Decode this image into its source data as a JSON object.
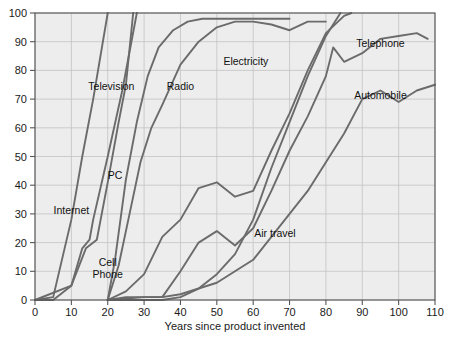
{
  "chart_data": {
    "type": "line",
    "title": "",
    "xlabel": "Years since product invented",
    "ylabel": "",
    "xlim": [
      0,
      110
    ],
    "ylim": [
      0,
      100
    ],
    "xticks": [
      0,
      10,
      20,
      30,
      40,
      50,
      60,
      70,
      80,
      90,
      100,
      110
    ],
    "yticks": [
      0,
      10,
      20,
      30,
      40,
      50,
      60,
      70,
      80,
      90,
      100
    ],
    "grid": true,
    "legend_position": "inline-labels",
    "series": [
      {
        "name": "Internet",
        "label": "Internet",
        "label_x": 10,
        "label_y": 30,
        "points": [
          [
            0,
            0
          ],
          [
            5,
            1
          ],
          [
            10,
            28
          ],
          [
            13,
            50
          ],
          [
            16,
            70
          ],
          [
            20,
            100
          ]
        ]
      },
      {
        "name": "Cell Phone",
        "label": "Cell Phone",
        "label_x": 20,
        "label_y": 12,
        "points": [
          [
            0,
            0
          ],
          [
            5,
            0
          ],
          [
            10,
            5
          ],
          [
            13,
            18
          ],
          [
            15,
            21
          ],
          [
            16,
            28
          ],
          [
            20,
            50
          ],
          [
            24,
            73
          ],
          [
            28,
            100
          ]
        ]
      },
      {
        "name": "PC",
        "label": "PC",
        "label_x": 22,
        "label_y": 42,
        "points": [
          [
            0,
            0
          ],
          [
            10,
            5
          ],
          [
            14,
            18
          ],
          [
            17,
            21
          ],
          [
            20,
            41
          ],
          [
            23,
            62
          ],
          [
            25,
            75
          ],
          [
            27,
            100
          ]
        ]
      },
      {
        "name": "Television",
        "label": "Television",
        "label_x": 21,
        "label_y": 73,
        "points": [
          [
            20,
            0
          ],
          [
            22,
            14
          ],
          [
            25,
            42
          ],
          [
            28,
            62
          ],
          [
            31,
            78
          ],
          [
            34,
            88
          ],
          [
            38,
            94
          ],
          [
            42,
            97
          ],
          [
            46,
            98
          ],
          [
            55,
            98
          ],
          [
            60,
            98
          ],
          [
            70,
            98
          ]
        ]
      },
      {
        "name": "Radio",
        "label": "Radio",
        "label_x": 40,
        "label_y": 73,
        "points": [
          [
            20,
            0
          ],
          [
            23,
            12
          ],
          [
            26,
            30
          ],
          [
            29,
            48
          ],
          [
            32,
            60
          ],
          [
            35,
            68
          ],
          [
            40,
            82
          ],
          [
            45,
            90
          ],
          [
            50,
            95
          ],
          [
            55,
            97
          ],
          [
            60,
            97
          ],
          [
            65,
            96
          ],
          [
            70,
            94
          ],
          [
            75,
            97
          ],
          [
            80,
            97
          ]
        ]
      },
      {
        "name": "Electricity",
        "label": "Electricity",
        "label_x": 58,
        "label_y": 82,
        "points": [
          [
            20,
            0
          ],
          [
            25,
            3
          ],
          [
            30,
            9
          ],
          [
            35,
            22
          ],
          [
            40,
            28
          ],
          [
            45,
            39
          ],
          [
            50,
            41
          ],
          [
            55,
            36
          ],
          [
            60,
            38
          ],
          [
            65,
            52
          ],
          [
            70,
            65
          ],
          [
            75,
            80
          ],
          [
            80,
            93
          ],
          [
            85,
            99
          ],
          [
            87,
            100
          ]
        ]
      },
      {
        "name": "Telephone",
        "label": "Telephone",
        "label_x": 95,
        "label_y": 88,
        "points": [
          [
            20,
            0
          ],
          [
            25,
            1
          ],
          [
            30,
            1
          ],
          [
            35,
            1
          ],
          [
            40,
            10
          ],
          [
            45,
            20
          ],
          [
            50,
            24
          ],
          [
            55,
            19
          ],
          [
            60,
            25
          ],
          [
            65,
            38
          ],
          [
            70,
            52
          ],
          [
            75,
            64
          ],
          [
            80,
            78
          ],
          [
            82,
            88
          ],
          [
            85,
            83
          ],
          [
            90,
            86
          ],
          [
            95,
            91
          ],
          [
            100,
            92
          ],
          [
            105,
            93
          ],
          [
            108,
            91
          ]
        ]
      },
      {
        "name": "Automobile",
        "label": "Automobile",
        "label_x": 95,
        "label_y": 70,
        "points": [
          [
            20,
            0
          ],
          [
            30,
            1
          ],
          [
            35,
            1
          ],
          [
            40,
            2
          ],
          [
            45,
            4
          ],
          [
            50,
            6
          ],
          [
            55,
            10
          ],
          [
            60,
            14
          ],
          [
            65,
            22
          ],
          [
            70,
            30
          ],
          [
            75,
            38
          ],
          [
            80,
            48
          ],
          [
            85,
            58
          ],
          [
            90,
            70
          ],
          [
            95,
            73
          ],
          [
            100,
            69
          ],
          [
            105,
            73
          ],
          [
            110,
            75
          ]
        ]
      },
      {
        "name": "Air travel",
        "label": "Air travel",
        "label_x": 66,
        "label_y": 22,
        "points": [
          [
            20,
            0
          ],
          [
            30,
            0
          ],
          [
            35,
            0
          ],
          [
            40,
            1
          ],
          [
            45,
            4
          ],
          [
            50,
            9
          ],
          [
            55,
            16
          ],
          [
            60,
            28
          ],
          [
            65,
            46
          ],
          [
            70,
            62
          ],
          [
            75,
            78
          ],
          [
            80,
            92
          ],
          [
            84,
            100
          ]
        ]
      }
    ]
  },
  "axis": {
    "x_tick_labels": [
      "0",
      "10",
      "20",
      "30",
      "40",
      "50",
      "60",
      "70",
      "80",
      "90",
      "100",
      "110"
    ],
    "y_tick_labels": [
      "0",
      "10",
      "20",
      "30",
      "40",
      "50",
      "60",
      "70",
      "80",
      "90",
      "100"
    ],
    "x_title": "Years since product invented"
  },
  "colors": {
    "plot_background": "#ededed",
    "gridline": "#c3c3c3",
    "series_line": "#6b6b6b",
    "frame": "#555555",
    "text": "#1a1a1a",
    "page_background": "#ffffff"
  }
}
